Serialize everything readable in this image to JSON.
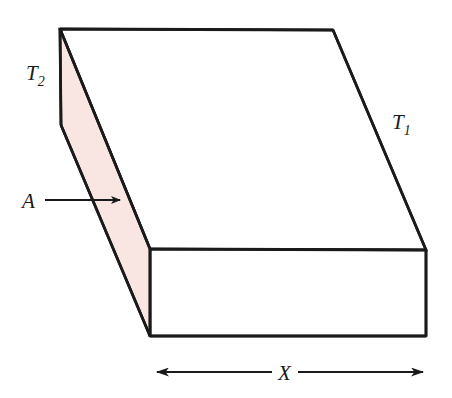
{
  "figure": {
    "background_color": "#ffffff",
    "width": 452,
    "height": 398,
    "stroke_color": "#1a1a1a",
    "face_fill_color": "#ffffff",
    "cross_section_fill_color": "#f9e6e2"
  },
  "labels": {
    "hot_face": {
      "symbol": "T",
      "subscript": "2",
      "full": "T2",
      "description": "temperature of the left (shaded) face",
      "x": 26,
      "y": 80
    },
    "cold_face": {
      "symbol": "T",
      "subscript": "1",
      "full": "T1",
      "description": "temperature of the right face",
      "x": 392,
      "y": 129
    },
    "area": {
      "symbol": "A",
      "full": "A",
      "description": "cross-sectional area, pointed to by arrow",
      "x": 22,
      "y": 207
    },
    "thickness": {
      "symbol": "X",
      "full": "X",
      "description": "slab thickness dimension",
      "x": 282,
      "y": 380
    }
  },
  "annotations": {
    "area_arrow": {
      "name": "area-pointer-arrow",
      "from_x": 45,
      "from_y": 200,
      "to_x": 122,
      "to_y": 200,
      "direction": "right"
    },
    "thickness_dimension": {
      "name": "x-dimension-line",
      "left_x": 155,
      "right_x": 425,
      "y": 372,
      "direction": "double-headed"
    }
  },
  "geometry": {
    "top_face_points": "60,29 333,30 426,250 150,249",
    "cross_section_points": "60,29 150,249 150,336 61,125",
    "front_face_points": "150,249 426,250 426,336 150,336"
  }
}
